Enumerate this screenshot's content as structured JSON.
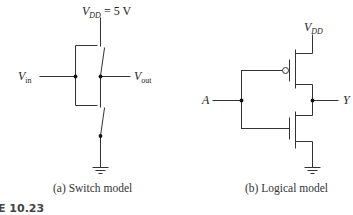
{
  "figure": {
    "number_label": "E 10.23",
    "panels": [
      {
        "id": "a",
        "caption": "(a) Switch model",
        "labels": {
          "supply_main": "V",
          "supply_sub": "DD",
          "supply_value": " = 5 V",
          "input_main": "V",
          "input_sub": "in",
          "output_main": "V",
          "output_sub": "out"
        }
      },
      {
        "id": "b",
        "caption": "(b) Logical model",
        "labels": {
          "supply_main": "V",
          "supply_sub": "DD",
          "input": "A",
          "output": "Y"
        }
      }
    ],
    "colors": {
      "line": "#333333",
      "text": "#222222",
      "background": "#ffffff"
    }
  }
}
